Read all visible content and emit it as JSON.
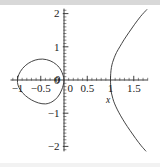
{
  "figure": {
    "background_color": "#ffffff",
    "curve_color": "#3a3a3a",
    "axis_color": "#2b2b2b",
    "top_band_color": "#d8d8d8"
  },
  "labels": {
    "x_axis_name": "x",
    "x_ticks": [
      "−1",
      "−0.5",
      "0",
      "0.5",
      "1",
      "1.5"
    ],
    "y_ticks": [
      "2",
      "1",
      "0",
      "−1",
      "−2"
    ],
    "y_zero_label": "0"
  },
  "chart_data": {
    "type": "line",
    "title": "",
    "xlabel": "x",
    "ylabel": "",
    "xlim": [
      -1.15,
      1.8
    ],
    "ylim": [
      -2.15,
      2.15
    ],
    "grid": false,
    "legend": "none",
    "x_tick_values": [
      -1,
      -0.5,
      0,
      0.5,
      1,
      1.5
    ],
    "y_tick_values": [
      2,
      1,
      0,
      -1,
      -2
    ],
    "x_minor_tick_step": 0.1,
    "y_minor_tick_step": 0.1,
    "series": [
      {
        "name": "left-loop",
        "description": "closed oval loop in the second and third quadrants spanning x from -1 to 0, y from -0.72 to 0.63, passing through the origin",
        "closed": true,
        "points": [
          [
            0.0,
            0.0
          ],
          [
            -0.06,
            0.28
          ],
          [
            -0.16,
            0.46
          ],
          [
            -0.3,
            0.58
          ],
          [
            -0.46,
            0.63
          ],
          [
            -0.62,
            0.6
          ],
          [
            -0.77,
            0.5
          ],
          [
            -0.89,
            0.35
          ],
          [
            -0.97,
            0.17
          ],
          [
            -1.0,
            0.0
          ],
          [
            -0.99,
            -0.15
          ],
          [
            -0.93,
            -0.32
          ],
          [
            -0.83,
            -0.47
          ],
          [
            -0.7,
            -0.6
          ],
          [
            -0.55,
            -0.69
          ],
          [
            -0.4,
            -0.72
          ],
          [
            -0.26,
            -0.66
          ],
          [
            -0.14,
            -0.52
          ],
          [
            -0.05,
            -0.3
          ],
          [
            0.0,
            0.0
          ]
        ]
      },
      {
        "name": "right-branch-upper",
        "description": "upper open branch starting at the vertex (1, 0) and rising to the upper-right corner at about (1.78, 2.1)",
        "closed": false,
        "points": [
          [
            1.0,
            0.0
          ],
          [
            1.005,
            0.2
          ],
          [
            1.02,
            0.38
          ],
          [
            1.045,
            0.53
          ],
          [
            1.08,
            0.67
          ],
          [
            1.13,
            0.83
          ],
          [
            1.2,
            1.0
          ],
          [
            1.29,
            1.21
          ],
          [
            1.4,
            1.44
          ],
          [
            1.52,
            1.68
          ],
          [
            1.65,
            1.92
          ],
          [
            1.78,
            2.12
          ]
        ]
      },
      {
        "name": "right-branch-lower",
        "description": "lower open branch starting at the vertex (1, 0) and falling to the lower-right corner at about (1.75, -2.1)",
        "closed": false,
        "points": [
          [
            1.0,
            0.0
          ],
          [
            1.005,
            -0.2
          ],
          [
            1.02,
            -0.39
          ],
          [
            1.05,
            -0.56
          ],
          [
            1.09,
            -0.72
          ],
          [
            1.15,
            -0.9
          ],
          [
            1.22,
            -1.08
          ],
          [
            1.31,
            -1.29
          ],
          [
            1.42,
            -1.52
          ],
          [
            1.54,
            -1.76
          ],
          [
            1.66,
            -1.98
          ],
          [
            1.76,
            -2.14
          ]
        ]
      }
    ]
  }
}
